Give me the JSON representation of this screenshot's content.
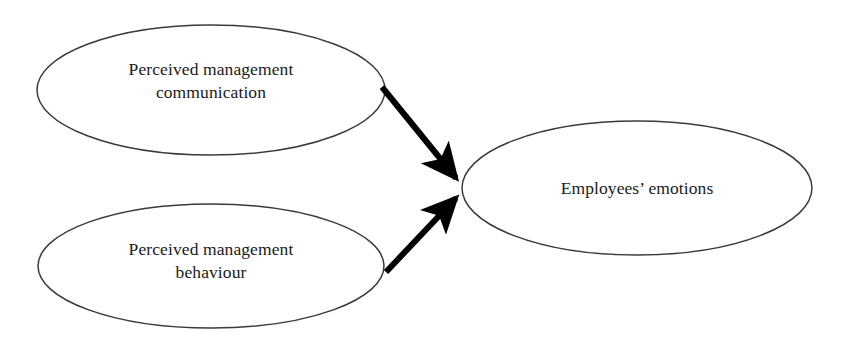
{
  "diagram": {
    "type": "conceptual-model",
    "background_color": "#ffffff",
    "ellipse_stroke_color": "#3a3a3a",
    "ellipse_fill_color": "#ffffff",
    "arrow_color": "#000000",
    "text_color": "#1a1a1a",
    "nodes": [
      {
        "id": "perceived-management-communication",
        "label": "Perceived management\ncommunication",
        "shape": "ellipse",
        "cx": 211,
        "cy": 90,
        "rx": 174,
        "ry": 65
      },
      {
        "id": "perceived-management-behaviour",
        "label": "Perceived management\nbehaviour",
        "shape": "ellipse",
        "cx": 211,
        "cy": 266,
        "rx": 173,
        "ry": 62
      },
      {
        "id": "employees-emotions",
        "label": "Employees’ emotions",
        "shape": "ellipse",
        "cx": 637,
        "cy": 188,
        "rx": 175,
        "ry": 67
      }
    ],
    "edges": [
      {
        "id": "communication-to-emotions",
        "from": "perceived-management-communication",
        "to": "employees-emotions",
        "style": "solid",
        "arrowhead": "filled-triangle",
        "x1": 382,
        "y1": 87,
        "x2": 462,
        "y2": 185
      },
      {
        "id": "behaviour-to-emotions",
        "from": "perceived-management-behaviour",
        "to": "employees-emotions",
        "style": "solid",
        "arrowhead": "filled-triangle",
        "x1": 386,
        "y1": 272,
        "x2": 462,
        "y2": 192
      }
    ]
  }
}
